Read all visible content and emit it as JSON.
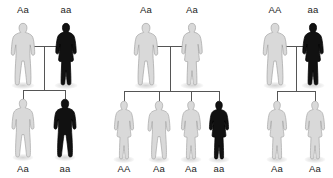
{
  "diagram": {
    "type": "pedigree",
    "legend": {
      "light_figure_meaning": "unaffected / carrier",
      "black_figure_meaning": "affected (aa, homozygous recessive)"
    },
    "colors": {
      "background": "#ffffff",
      "light_fill": "#d9d9d9",
      "light_stroke": "#a6a6a6",
      "dark_fill": "#111111",
      "dark_stroke": "#000000",
      "connector": "#555555",
      "label_text": "#1c1c1c"
    },
    "crosses": [
      {
        "id": "cross-1",
        "parents": [
          {
            "genotype": "Aa",
            "sex": "male",
            "phenotype": "unaffected",
            "shade": "light",
            "x": 23,
            "y": 22
          },
          {
            "genotype": "aa",
            "sex": "female",
            "phenotype": "affected",
            "shade": "dark",
            "x": 66,
            "y": 22
          }
        ],
        "children": [
          {
            "genotype": "Aa",
            "sex": "male",
            "phenotype": "unaffected",
            "shade": "light",
            "x": 23,
            "y": 98
          },
          {
            "genotype": "aa",
            "sex": "male",
            "phenotype": "affected",
            "shade": "dark",
            "x": 65,
            "y": 98
          }
        ]
      },
      {
        "id": "cross-2",
        "parents": [
          {
            "genotype": "Aa",
            "sex": "male",
            "phenotype": "unaffected",
            "shade": "light",
            "x": 146,
            "y": 22
          },
          {
            "genotype": "Aa",
            "sex": "female",
            "phenotype": "unaffected",
            "shade": "light",
            "x": 192,
            "y": 22
          }
        ],
        "children": [
          {
            "genotype": "AA",
            "sex": "female",
            "phenotype": "unaffected",
            "shade": "light",
            "x": 124,
            "y": 100
          },
          {
            "genotype": "Aa",
            "sex": "male",
            "phenotype": "unaffected",
            "shade": "light",
            "x": 159,
            "y": 100
          },
          {
            "genotype": "Aa",
            "sex": "female",
            "phenotype": "unaffected",
            "shade": "light",
            "x": 191,
            "y": 100
          },
          {
            "genotype": "aa",
            "sex": "female",
            "phenotype": "affected",
            "shade": "dark",
            "x": 219,
            "y": 100
          }
        ]
      },
      {
        "id": "cross-3",
        "parents": [
          {
            "genotype": "AA",
            "sex": "male",
            "phenotype": "unaffected",
            "shade": "light",
            "x": 275,
            "y": 22
          },
          {
            "genotype": "aa",
            "sex": "female",
            "phenotype": "affected",
            "shade": "dark",
            "x": 313,
            "y": 22
          }
        ],
        "children": [
          {
            "genotype": "Aa",
            "sex": "female",
            "phenotype": "unaffected",
            "shade": "light",
            "x": 277,
            "y": 100
          },
          {
            "genotype": "Aa",
            "sex": "female",
            "phenotype": "unaffected",
            "shade": "light",
            "x": 315,
            "y": 100
          }
        ]
      }
    ]
  }
}
